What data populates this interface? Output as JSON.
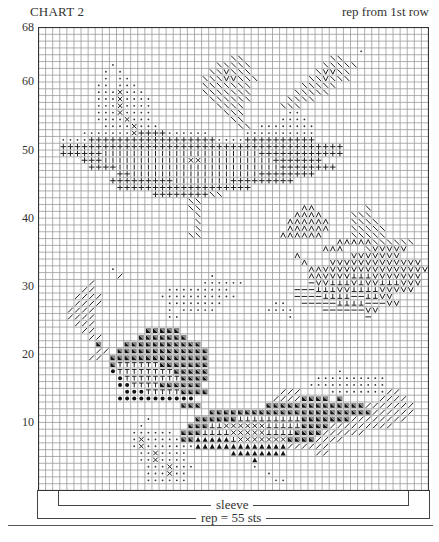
{
  "header": {
    "title": "CHART 2",
    "note": "rep from 1st row"
  },
  "footer": {
    "sleeve_label": "sleeve",
    "rep_label": "rep = 55 sts"
  },
  "chart_data": {
    "type": "table",
    "title": "CHART 2",
    "subtitle": "rep from 1st row",
    "columns": 55,
    "rows": 68,
    "y_ticks": [
      10,
      20,
      30,
      40,
      50,
      60,
      68
    ],
    "xlabel": "rep = 55 sts",
    "annotations": [
      "sleeve",
      "rep = 55 sts",
      "rep from 1st row"
    ],
    "grid": true,
    "legend_symbols": {
      ".": "small dot",
      "o": "large dot",
      "x": "cross X",
      "+": "plus",
      "|": "vertical bar",
      "\\": "backslash",
      "/": "slash",
      "v": "V",
      "^": "inverted V (A)",
      "t": "T",
      "u": "inverted T",
      "-": "dash",
      "d": "filled triangle (diagonal half)",
      "a": "filled up-triangle"
    },
    "rows_top_to_bottom": [
      ".......................................................",
      ".......................................................",
      ".......................................................",
      ".............................................,........",
      "...........................\\\\............\\\\..........",
      "..........,..............\\\\\\\\\\..........\\\\\\\\\\.........",
      ".........,.,............\\\\v\\\\\\.........\\vv\\\\.........",
      ".........,.,,..........\\\\\\vv\\\\\\.......\\\\v\\\\\\..........",
      "........,,.,,,.........\\\\\\\\\\\\\\.......\\\\\\\\\\...........",
      "........,,,x,,,........\\\\\\\\\\\\\\......\\\\\\\\\\............",
      "........,,,x,,,,........\\\\\\\\\\\\.....\\\\\\\\..............",
      "........,,,x,,,,.........\\\\\\\\.....\\\\\\................",
      "........,,,x,,,,..........\\\\\\......,,...............",
      "........,,,,x,,,...........\\\\.....,,,,...............",
      ".........,,,,x,,,...........\\\\.,,,,,,,,..............",
      "......,,,,,,,x++++,,,,,,.....,,,,,,,,,,...............",
      "...,,,,++++++++++++++++++,,,,++++++++++..............",
      "...++++++++++++++++++++++++++++++++++++++++............",
      "...++++++||||||||||||||||||||||++++++++++++............",
      "......+++||||||||||||xx||||||||||+++++++..............",
      ".......++++|||||||||||||||||||||||++++++++............",
      "...........++||||||||||||||||||++++++++...............",
      "..........+++++++++||||||||+++++++++...................",
      "...........+++++++++++++++++++.........................",
      "................++++++++\\\\............................",
      ".....................\\\\...............................",
      ".....................\\\\..............^^.......\\......",
      "......................\\.............^^^^....\\\\\\.......",
      "......................\\............^^^^^^...\\\\\\\\......",
      "......................\\............^^^^^^...\\\\\\\\\\.....",
      ".....................\\\\...........^^^^^^....\\\\\\\\\\....",
      "..........................................^^^^^\\\\\\\\\\\\......",
      "........................................^^^...\\vvvvv....",
      "....................................^.......vvvvvvv......",
      ".....................................^...vvvvvvvvvvvvv..",
      "..........,...........................^^vvvvvvvvvvvvvvv.",
      ".........../............,.............^^vvvvuuuvvvvvvv..",
      "......./...............,,,,,,.........-vvuuuvuvvuuuvvv..",
      "......//..........,,,,,,,,,.........---uuuvvuuuuvvvvv...",
      ".....////........,,,,,,,,,,,........----uuuu--uuvv.......",
      ".....////.........,,,,,,,,.......,,..-----uuuu---vv.......",
      "....////..........,.,,,,,.......,,,,....------vv.........",
      "....////..........,,...............,..........-.........",
      ".....///..............................................",
      "......//.......ddddd..................................",
      ".......//.....ddddddd.................................",
      "........d...ddddddddddd...............................",
      "........//.ddddddddddddd..............................",
      ".......//.dddddddddddddd..............................",
      "..........dttttttddddddd..............................",
      "..........ottttttttddddd..................,...........",
      "...........ottttttttdddd...............,,,,,,,,,,.....",
      "...........oottttdddddd...............,,,,,,,,,,,.....",
      "............oootttttdddd..........///....,,,,,,,,//...",
      "...........ooooooooooo...........////dddd.d.....////..",
      "....................ddd.........dddddddddddddd///////.",
      "........................ddddddddddddddddddddddd//////.",
      "...............,......dddddduuuuuuuuuddddddd////////..",
      "..............,......ddduuxxxxxxuuuuudddd/////////....",
      ".............,,,,,,.ddduuuuxxxxxuuuudddd//////......",
      ".............,x,,,,,ddaaaaauxxxxxxxdddd////..........",
      ".............,x,,,,,,,aaaaaaaaaaaaa//////.............",
      "..............,,x,,,,......aaaaaaaa....//.............",
      "..............,,x,,,,.........a.......................",
      "...............,,,x,,,........,........................",
      "...............,,,x,,...........,......................",
      "...............,,,,,,............,,.....................",
      "......................................................."
    ]
  }
}
